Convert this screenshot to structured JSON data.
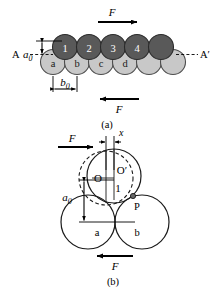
{
  "figure": {
    "panel_a": {
      "caption": "(a)",
      "top_row_label": "top-layer-atoms",
      "top_atoms": [
        "1",
        "2",
        "3",
        "4",
        ""
      ],
      "bottom_atoms": [
        "a",
        "b",
        "c",
        "d",
        "",
        ""
      ],
      "force_top": "F",
      "force_bottom": "F",
      "section_left": "A",
      "section_right": "A′",
      "dim_vertical": "a",
      "dim_vertical_sub": "0",
      "dim_horizontal": "b",
      "dim_horizontal_sub": "0",
      "colors": {
        "top_atom_fill": "#595959",
        "top_atom_stroke": "#2b2b2b",
        "bottom_atom_fill": "#c8c8c8",
        "bottom_atom_stroke": "#4d4d4d",
        "label_light": "#ffffff",
        "label_dark": "#1a1a1a",
        "line": "#000000"
      }
    },
    "panel_b": {
      "caption": "(b)",
      "force_top": "F",
      "force_bottom": "F",
      "displacement": "x",
      "center_dashed": "O",
      "center_solid": "O′",
      "moving_atom": "1",
      "contact_point": "P",
      "dim_vertical": "a",
      "dim_vertical_sub": "0",
      "lower_atoms": [
        "a",
        "b"
      ],
      "colors": {
        "circle_stroke": "#1a1a1a",
        "dashed_stroke": "#1a1a1a",
        "point_fill": "#666666",
        "line": "#000000"
      }
    }
  }
}
